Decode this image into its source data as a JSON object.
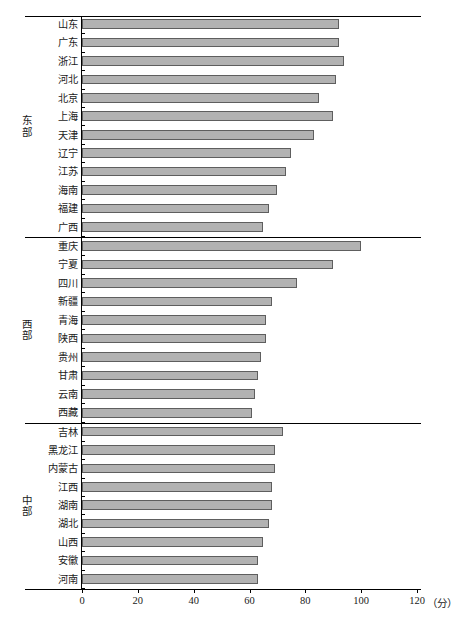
{
  "chart_data": {
    "type": "bar",
    "orientation": "horizontal",
    "title": "",
    "xlabel": "分",
    "ylabel": "",
    "xlim": [
      0,
      120
    ],
    "xticks": [
      0,
      20,
      40,
      60,
      80,
      100,
      120
    ],
    "xtick_labels": [
      "0",
      "20",
      "40",
      "60",
      "80",
      "100",
      "120"
    ],
    "unit_label": "（分）",
    "grid": false,
    "legend": false,
    "groups": [
      {
        "name": "东部",
        "name_chars": [
          "东",
          "部"
        ],
        "categories": [
          "山东",
          "广东",
          "浙江",
          "河北",
          "北京",
          "上海",
          "天津",
          "辽宁",
          "江苏",
          "海南",
          "福建",
          "广西"
        ],
        "values": [
          92,
          92,
          94,
          91,
          85,
          90,
          83,
          75,
          73,
          70,
          67,
          65
        ]
      },
      {
        "name": "西部",
        "name_chars": [
          "西",
          "部"
        ],
        "categories": [
          "重庆",
          "宁夏",
          "四川",
          "新疆",
          "青海",
          "陕西",
          "贵州",
          "甘肃",
          "云南",
          "西藏"
        ],
        "values": [
          100,
          90,
          77,
          68,
          66,
          66,
          64,
          63,
          62,
          61
        ]
      },
      {
        "name": "中部",
        "name_chars": [
          "中",
          "部"
        ],
        "categories": [
          "吉林",
          "黑龙江",
          "内蒙古",
          "江西",
          "湖南",
          "湖北",
          "山西",
          "安徽",
          "河南"
        ],
        "values": [
          72,
          69,
          69,
          68,
          68,
          67,
          65,
          63,
          63
        ]
      }
    ],
    "bar_color": "#b2b2b2",
    "bar_border_color": "#5e5e5e",
    "axis_color": "#000000"
  }
}
